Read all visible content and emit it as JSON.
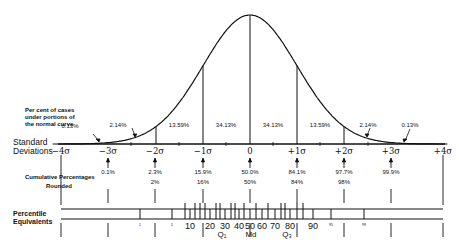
{
  "labels": {
    "area_row": [
      "Per cent of cases",
      "under portions of",
      "the normal curve"
    ],
    "sd_row": [
      "Standard",
      "Deviations"
    ],
    "cum_row": "Cumulative Percentages",
    "rounded_row": "Rounded",
    "percentile_row": [
      "Percentile",
      "Equivalents"
    ]
  },
  "area_percents": [
    {
      "label": "0.13%",
      "x": 70,
      "y": 123
    },
    {
      "label": "2.14%",
      "x": 118,
      "y": 122
    },
    {
      "label": "13.59%",
      "x": 179,
      "y": 122
    },
    {
      "label": "34.13%",
      "x": 226,
      "y": 122
    },
    {
      "label": "34.13%",
      "x": 273,
      "y": 122
    },
    {
      "label": "13.59%",
      "x": 320,
      "y": 122
    },
    {
      "label": "2.14%",
      "x": 368,
      "y": 122
    },
    {
      "label": "0.13%",
      "x": 410,
      "y": 122
    }
  ],
  "standard_deviations": [
    {
      "label": "−4σ",
      "x": 61
    },
    {
      "label": "−3σ",
      "x": 108
    },
    {
      "label": "−2σ",
      "x": 155
    },
    {
      "label": "−1σ",
      "x": 203
    },
    {
      "label": "0",
      "x": 250
    },
    {
      "label": "+1σ",
      "x": 297
    },
    {
      "label": "+2σ",
      "x": 344
    },
    {
      "label": "+3σ",
      "x": 391
    },
    {
      "label": "+4σ",
      "x": 443
    }
  ],
  "cumulative_percentages": [
    {
      "label": "0.1%",
      "x": 108
    },
    {
      "label": "2.3%",
      "x": 155
    },
    {
      "label": "15.9%",
      "x": 203
    },
    {
      "label": "50.0%",
      "x": 250
    },
    {
      "label": "84.1%",
      "x": 297
    },
    {
      "label": "97.7%",
      "x": 344
    },
    {
      "label": "99.9%",
      "x": 391
    }
  ],
  "rounded": [
    {
      "label": "2%",
      "x": 155
    },
    {
      "label": "16%",
      "x": 203
    },
    {
      "label": "50%",
      "x": 250
    },
    {
      "label": "84%",
      "x": 297
    },
    {
      "label": "98%",
      "x": 344
    }
  ],
  "percentile_equivalents": [
    {
      "label": "1",
      "x": 140,
      "small": true
    },
    {
      "label": "5",
      "x": 172,
      "small": true
    },
    {
      "label": "10",
      "x": 190
    },
    {
      "label": "20",
      "x": 210
    },
    {
      "label": "30",
      "x": 225
    },
    {
      "label": "40",
      "x": 239
    },
    {
      "label": "50",
      "x": 250
    },
    {
      "label": "60",
      "x": 262
    },
    {
      "label": "70",
      "x": 275
    },
    {
      "label": "80",
      "x": 290
    },
    {
      "label": "90",
      "x": 313
    },
    {
      "label": "95",
      "x": 331,
      "small": true
    },
    {
      "label": "99",
      "x": 364,
      "small": true
    }
  ],
  "quartiles": [
    {
      "label": "Q₁",
      "x": 222
    },
    {
      "label": "Md",
      "x": 251
    },
    {
      "label": "Q₃",
      "x": 287
    }
  ],
  "chart_data": {
    "type": "diagram",
    "sigma_positions": [
      -4,
      -3,
      -2,
      -1,
      0,
      1,
      2,
      3,
      4
    ],
    "area_percent_between_sigmas": [
      0.13,
      2.14,
      13.59,
      34.13,
      34.13,
      13.59,
      2.14,
      0.13
    ],
    "cumulative_percentages": [
      0.1,
      2.3,
      15.9,
      50.0,
      84.1,
      97.7,
      99.9
    ],
    "cumulative_rounded": [
      2,
      16,
      50,
      84,
      98
    ],
    "percentile_ticks": [
      1,
      5,
      10,
      20,
      30,
      40,
      50,
      60,
      70,
      80,
      90,
      95,
      99
    ],
    "quartile_markers": [
      "Q1",
      "Md",
      "Q3"
    ]
  }
}
